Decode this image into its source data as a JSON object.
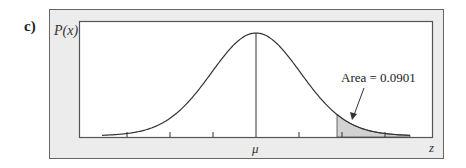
{
  "panel_label": "c)",
  "colors": {
    "frame_fill": "#ececec",
    "frame_stroke": "#555555",
    "plot_bg": "#ffffff",
    "curve": "#333333",
    "shade": "#d4d4d4"
  },
  "chart_data": {
    "type": "area",
    "title": "",
    "subtitle": "Normal distribution with shaded right tail",
    "xlabel": "z",
    "ylabel": "P(x)",
    "x_tick_labels": [
      "",
      "",
      "",
      "μ",
      "",
      "",
      ""
    ],
    "center_label": "μ",
    "num_ticks": 7,
    "grid": false,
    "legend": null,
    "distribution": "normal",
    "shaded_region": {
      "side": "right-tail",
      "start_sd_from_mean": 1.34,
      "area": 0.0901
    },
    "annotations": [
      {
        "text": "Area = 0.0901",
        "points_to": "shaded right tail"
      }
    ],
    "x_range_sd": [
      -3.6,
      3.6
    ]
  }
}
